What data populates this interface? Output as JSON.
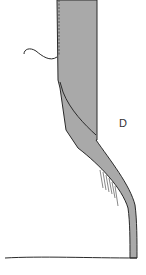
{
  "figure": {
    "label": "D",
    "colors": {
      "fabric_fill": "#a9a9a9",
      "outline": "#2a2a2a",
      "background": "#ffffff"
    }
  }
}
